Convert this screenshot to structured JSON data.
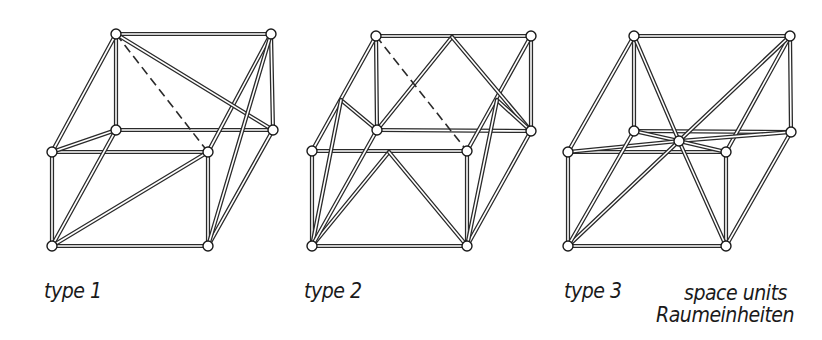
{
  "labels": {
    "type1": "type 1",
    "type2": "type 2",
    "type3": "type 3",
    "space_units_en": "space units",
    "space_units_de": "Raumeinheiten"
  },
  "style": {
    "strut_color": "#2a2a2a",
    "strut_fill": "#ffffff",
    "node_fill": "#ffffff",
    "node_stroke": "#1a1a1a",
    "dashed_color": "#2a2a2a"
  },
  "figures": [
    {
      "id": "type1",
      "nodes": {
        "A": [
          116,
          34
        ],
        "B": [
          271,
          34
        ],
        "C": [
          116,
          130
        ],
        "D": [
          273,
          130
        ],
        "E": [
          52,
          152
        ],
        "F": [
          208,
          152
        ],
        "G": [
          52,
          246
        ],
        "H": [
          208,
          246
        ]
      },
      "struts": [
        [
          "A",
          "B"
        ],
        [
          "A",
          "C"
        ],
        [
          "B",
          "D"
        ],
        [
          "C",
          "D"
        ],
        [
          "E",
          "F"
        ],
        [
          "E",
          "G"
        ],
        [
          "F",
          "H"
        ],
        [
          "G",
          "H"
        ],
        [
          "A",
          "E"
        ],
        [
          "B",
          "F"
        ],
        [
          "D",
          "H"
        ],
        [
          "C",
          "E"
        ],
        [
          "A",
          "D"
        ],
        [
          "B",
          "H"
        ],
        [
          "G",
          "C"
        ],
        [
          "G",
          "F"
        ]
      ],
      "dashed": [
        [
          "A",
          "F"
        ]
      ],
      "points": []
    },
    {
      "id": "type2",
      "nodes": {
        "A": [
          376,
          36
        ],
        "B": [
          531,
          36
        ],
        "C": [
          377,
          130
        ],
        "D": [
          531,
          131
        ],
        "E": [
          312,
          151
        ],
        "F": [
          467,
          151
        ],
        "G": [
          312,
          246
        ],
        "H": [
          467,
          246
        ]
      },
      "points": {
        "P": [
          452,
          37
        ],
        "Q": [
          389,
          152
        ],
        "L": [
          341,
          100
        ],
        "R": [
          497,
          100
        ]
      },
      "struts": [
        [
          "A",
          "B"
        ],
        [
          "A",
          "C"
        ],
        [
          "B",
          "D"
        ],
        [
          "C",
          "D"
        ],
        [
          "E",
          "F"
        ],
        [
          "E",
          "G"
        ],
        [
          "F",
          "H"
        ],
        [
          "G",
          "H"
        ],
        [
          "A",
          "E"
        ],
        [
          "B",
          "F"
        ],
        [
          "D",
          "H"
        ],
        [
          "C",
          "P"
        ],
        [
          "P",
          "D"
        ],
        [
          "G",
          "Q"
        ],
        [
          "Q",
          "H"
        ],
        [
          "L",
          "C"
        ],
        [
          "L",
          "G"
        ],
        [
          "R",
          "D"
        ],
        [
          "R",
          "H"
        ],
        [
          "G",
          "C"
        ]
      ],
      "dashed": [
        [
          "A",
          "F"
        ]
      ]
    },
    {
      "id": "type3",
      "nodes": {
        "A": [
          634,
          36
        ],
        "B": [
          790,
          36
        ],
        "C": [
          634,
          131
        ],
        "D": [
          791,
          132
        ],
        "E": [
          568,
          152
        ],
        "F": [
          726,
          152
        ],
        "G": [
          568,
          246
        ],
        "H": [
          726,
          246
        ],
        "M": [
          679,
          141
        ]
      },
      "struts": [
        [
          "A",
          "B"
        ],
        [
          "A",
          "C"
        ],
        [
          "B",
          "D"
        ],
        [
          "C",
          "D"
        ],
        [
          "E",
          "F"
        ],
        [
          "E",
          "G"
        ],
        [
          "F",
          "H"
        ],
        [
          "G",
          "H"
        ],
        [
          "A",
          "E"
        ],
        [
          "B",
          "F"
        ],
        [
          "D",
          "H"
        ],
        [
          "M",
          "A"
        ],
        [
          "M",
          "B"
        ],
        [
          "M",
          "C"
        ],
        [
          "M",
          "D"
        ],
        [
          "M",
          "E"
        ],
        [
          "M",
          "F"
        ],
        [
          "M",
          "G"
        ],
        [
          "M",
          "H"
        ],
        [
          "G",
          "C"
        ]
      ],
      "dashed": [],
      "points": []
    }
  ]
}
